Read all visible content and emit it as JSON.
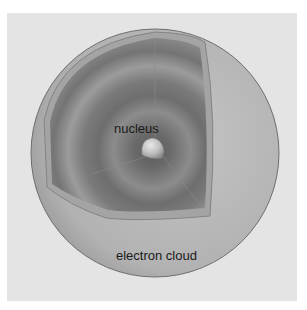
{
  "diagram": {
    "labels": {
      "nucleus": "nucleus",
      "electron_cloud": "electron cloud"
    },
    "colors": {
      "panel_background": "#e4e4e4",
      "sphere_surface": "#b4b4b4",
      "sphere_outline": "#6e6e6e",
      "cutaway_dark": "#5a5a5a",
      "cutaway_light": "#a8a8a8",
      "nucleus": "#c8c8c8"
    }
  }
}
